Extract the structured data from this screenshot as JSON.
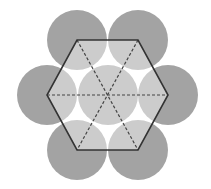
{
  "diagram": {
    "colors": {
      "background": "#ffffff",
      "outer_fill": "#a3a3a3",
      "inner_fill": "#cccccc",
      "hexagon_stroke": "#333333",
      "dashed_stroke": "#444444"
    },
    "circle_radius": 30,
    "center": {
      "x": 108,
      "y": 95
    },
    "circles": [
      {
        "id": "top-left",
        "cx": 77,
        "cy": 40
      },
      {
        "id": "top-right",
        "cx": 138,
        "cy": 40
      },
      {
        "id": "right",
        "cx": 168,
        "cy": 95
      },
      {
        "id": "bottom-right",
        "cx": 138,
        "cy": 150
      },
      {
        "id": "bottom-left",
        "cx": 77,
        "cy": 150
      },
      {
        "id": "left",
        "cx": 47,
        "cy": 95
      },
      {
        "id": "center",
        "cx": 108,
        "cy": 95
      }
    ],
    "hexagon_vertices": [
      [
        77,
        40
      ],
      [
        138,
        40
      ],
      [
        168,
        95
      ],
      [
        138,
        150
      ],
      [
        77,
        150
      ],
      [
        47,
        95
      ]
    ],
    "dashed_diagonals": [
      [
        [
          47,
          95
        ],
        [
          168,
          95
        ]
      ],
      [
        [
          77,
          40
        ],
        [
          138,
          150
        ]
      ],
      [
        [
          138,
          40
        ],
        [
          77,
          150
        ]
      ]
    ]
  }
}
